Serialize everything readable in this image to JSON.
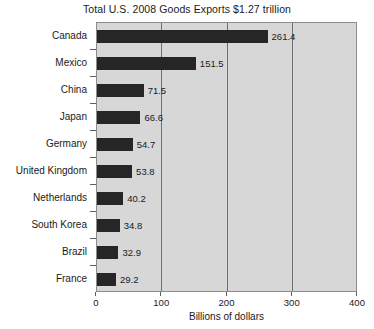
{
  "chart_data": {
    "type": "bar",
    "orientation": "horizontal",
    "title": "Total U.S. 2008 Goods Exports $1.27 trillion",
    "xlabel": "Billions of dollars",
    "ylabel": "",
    "xlim": [
      0,
      400
    ],
    "xticks": [
      0,
      100,
      200,
      300,
      400
    ],
    "xtick_labels": [
      "0",
      "100",
      "200",
      "300",
      "400"
    ],
    "grid": true,
    "grid_axis": "x",
    "legend": null,
    "categories": [
      "Canada",
      "Mexico",
      "China",
      "Japan",
      "Germany",
      "United Kingdom",
      "Netherlands",
      "South Korea",
      "Brazil",
      "France"
    ],
    "values": [
      261.4,
      151.5,
      71.5,
      66.6,
      54.7,
      53.8,
      40.2,
      34.8,
      32.9,
      29.2
    ],
    "data_labels": [
      "261.4",
      "151.5",
      "71.5",
      "66.6",
      "54.7",
      "53.8",
      "40.2",
      "34.8",
      "32.9",
      "29.2"
    ],
    "colors": {
      "bar": "#262626",
      "plot_background": "#d7d7d7",
      "figure_background": "#ffffff",
      "gridline": "#6f6f6f",
      "axis_border": "#8c8c8c",
      "text": "#1a1a1a"
    }
  }
}
